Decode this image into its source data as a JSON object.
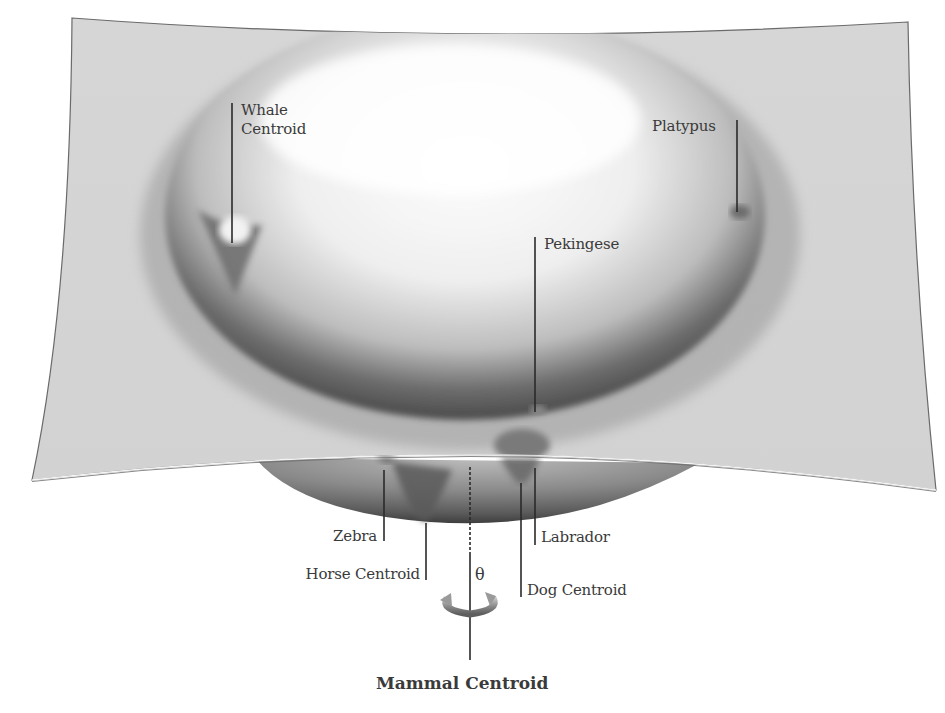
{
  "diagram": {
    "title": "Mammal Centroid",
    "rotation_symbol": "θ",
    "colors": {
      "surface": "#d4d4d4",
      "surface_highlight": "#fbfbfb",
      "surface_edge": "#6a6a6a",
      "bowl_dark": "#4a4a4a",
      "leader_line": "#2a2a2a",
      "text": "#3a3a3a"
    },
    "labels": [
      {
        "id": "whale",
        "text_lines": [
          "Whale",
          "Centroid"
        ],
        "position": "upper-left on surface"
      },
      {
        "id": "platypus",
        "text": "Platypus",
        "position": "upper-right on surface"
      },
      {
        "id": "pekingese",
        "text": "Pekingese",
        "position": "center of bowl"
      },
      {
        "id": "zebra",
        "text": "Zebra",
        "position": "below surface, left"
      },
      {
        "id": "horse",
        "text": "Horse Centroid",
        "position": "below surface, left"
      },
      {
        "id": "labrador",
        "text": "Labrador",
        "position": "below surface, right"
      },
      {
        "id": "dog",
        "text": "Dog Centroid",
        "position": "below surface, right"
      }
    ],
    "axis": {
      "label": "Mammal Centroid",
      "rotation_label": "θ",
      "icon": "rotation-arrow-icon"
    }
  }
}
